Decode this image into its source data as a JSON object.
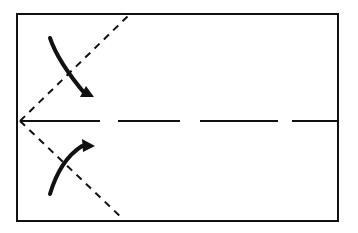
{
  "diagram": {
    "title": "Paper folding step: fold corners to center line",
    "colors": {
      "line": "#111111",
      "background": "#ffffff"
    },
    "paper": {
      "x": 17,
      "y": 14,
      "width": 321,
      "height": 207
    },
    "center_crease": {
      "type": "dashed",
      "y": 121
    },
    "fold_lines": [
      {
        "name": "upper-valley-fold",
        "type": "dashed",
        "from": [
          20,
          121
        ],
        "to": [
          130,
          14
        ]
      },
      {
        "name": "lower-valley-fold",
        "type": "dashed",
        "from": [
          20,
          121
        ],
        "to": [
          123,
          219
        ]
      }
    ],
    "arrows": [
      {
        "name": "upper-fold-arrow",
        "direction": "down-right"
      },
      {
        "name": "lower-fold-arrow",
        "direction": "up-right"
      }
    ]
  }
}
